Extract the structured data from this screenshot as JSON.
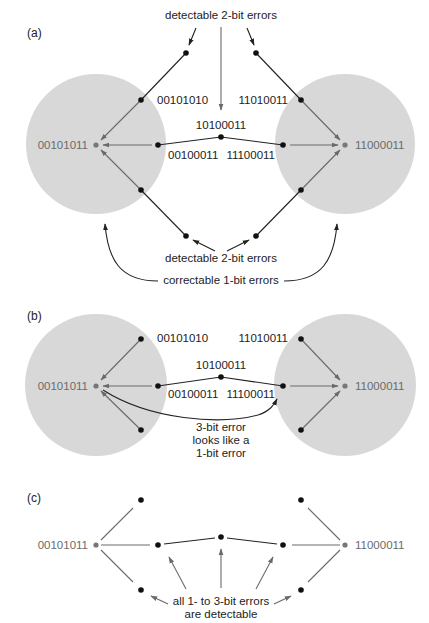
{
  "colors": {
    "zone_fill": "#d8d8d8",
    "codeword_text": "#6b6b6b",
    "dot": "#111111",
    "codeword_dot": "#777777",
    "arrow_grey": "#6a6a6a",
    "line_dark": "#222222"
  },
  "codewords": {
    "left": "00101011",
    "right": "11000011"
  },
  "panels": [
    {
      "id": "a",
      "label": "(a)",
      "label_pos": [
        27,
        37
      ],
      "cy": 145,
      "zones": true,
      "labels": {
        "left_upper": "00101010",
        "right_upper": "11010011",
        "middle_top": "10100011",
        "left_mid": "00100011",
        "right_mid": "11100011"
      },
      "annotations": {
        "top": "detectable 2-bit errors",
        "bottom": "detectable 2-bit errors",
        "correctable": "correctable 1-bit errors"
      }
    },
    {
      "id": "b",
      "label": "(b)",
      "label_pos": [
        27,
        320
      ],
      "cy": 385,
      "zones": true,
      "labels": {
        "left_upper": "00101010",
        "right_upper": "11010011",
        "middle_top": "10100011",
        "left_mid": "00100011",
        "right_mid": "11100011"
      },
      "annotations": {
        "three_bit_line1": "3-bit error",
        "three_bit_line2": "looks like a",
        "three_bit_line3": "1-bit error"
      }
    },
    {
      "id": "c",
      "label": "(c)",
      "label_pos": [
        27,
        502
      ],
      "cy": 545,
      "zones": false,
      "annotations": {
        "detectable_line1": "all 1- to 3-bit errors",
        "detectable_line2": "are detectable"
      }
    }
  ]
}
